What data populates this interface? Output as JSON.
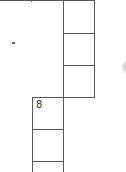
{
  "puzzle": {
    "type": "crossword-fragment",
    "cells": [
      {
        "id": "r0c1",
        "number": ""
      },
      {
        "id": "r1c1",
        "number": ""
      },
      {
        "id": "r2c1",
        "number": ""
      },
      {
        "id": "r3c0",
        "number": "8"
      },
      {
        "id": "r4c0",
        "number": ""
      },
      {
        "id": "r5c0",
        "number": ""
      }
    ]
  }
}
